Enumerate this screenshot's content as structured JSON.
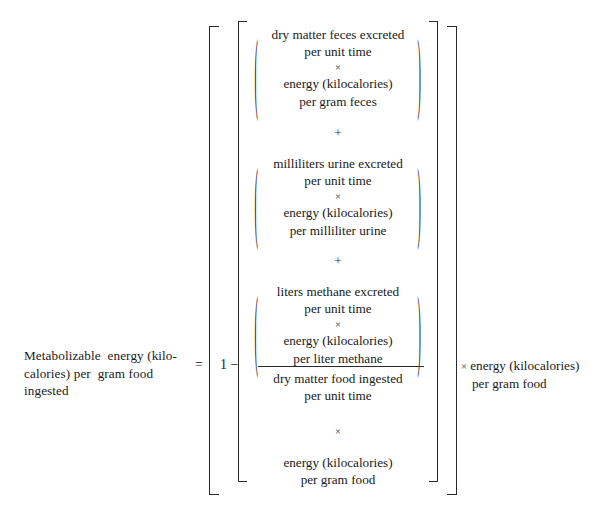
{
  "equation": {
    "lhs": {
      "lines": [
        "Metabolizable  energy (kilo-",
        "calories) per  gram food",
        "ingested"
      ]
    },
    "equals": "=",
    "one_minus": "1 −",
    "numerator": {
      "groups": [
        {
          "name": "feces",
          "open_paren": "(",
          "close_paren": ")",
          "lines": [
            "dry matter feces excreted",
            "per unit time"
          ],
          "operator": "×",
          "lines2": [
            "energy (kilocalories)",
            "per gram feces"
          ]
        },
        {
          "name": "urine",
          "open_paren": "(",
          "close_paren": ")",
          "lines": [
            "milliliters urine excreted",
            "per unit time"
          ],
          "operator": "×",
          "lines2": [
            "energy (kilocalories)",
            "per milliliter urine"
          ]
        },
        {
          "name": "methane",
          "open_paren": "(",
          "close_paren": ")",
          "lines": [
            "liters methane excreted",
            "per unit time"
          ],
          "operator": "×",
          "lines2": [
            "energy (kilocalories)",
            "per liter methane"
          ]
        }
      ],
      "separators": [
        "+",
        "+"
      ]
    },
    "denominator": {
      "food_lines": [
        "dry matter food ingested",
        "per unit time"
      ],
      "operator": "×",
      "energy_lines": [
        "energy (kilocalories)",
        "per gram food"
      ]
    },
    "rhs_factor": {
      "operator": "×",
      "line1": "energy (kilocalories)",
      "line2": "per gram food"
    }
  },
  "style": {
    "ink_color": "#1a1a1a",
    "rule_color": "#2a2a2a",
    "background": "#ffffff"
  }
}
